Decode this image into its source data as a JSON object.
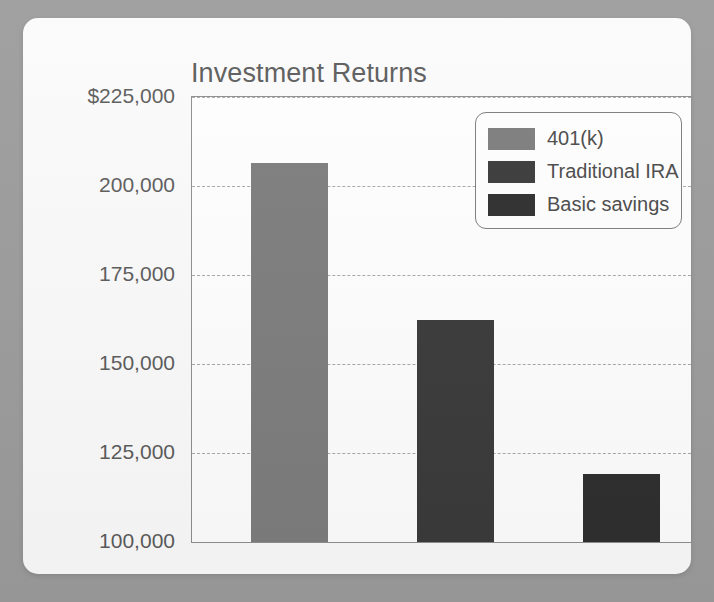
{
  "card": {
    "background_color": "#fbfbfb",
    "page_background_color": "#9c9c9c"
  },
  "chart_data": {
    "type": "bar",
    "title": "Investment Returns",
    "xlabel": "",
    "ylabel": "",
    "categories": [
      "401(k)",
      "Traditional IRA",
      "Basic savings"
    ],
    "values": [
      206500,
      162300,
      119000
    ],
    "ylim": [
      100000,
      225000
    ],
    "yticks": [
      100000,
      125000,
      150000,
      175000,
      200000,
      225000
    ],
    "ytick_labels": [
      "100,000",
      "125,000",
      "150,000",
      "175,000",
      "200,000",
      "$225,000"
    ],
    "grid": true,
    "legend_position": "upper right",
    "series": [
      {
        "name": "401(k)",
        "value": 206500,
        "color": "#7d7d7d"
      },
      {
        "name": "Traditional IRA",
        "value": 162300,
        "color": "#3a3a3a"
      },
      {
        "name": "Basic savings",
        "value": 119000,
        "color": "#2e2e2e"
      }
    ],
    "legend": [
      {
        "label": "401(k)",
        "color": "#7d7d7d"
      },
      {
        "label": "Traditional IRA",
        "color": "#3a3a3a"
      },
      {
        "label": "Basic savings",
        "color": "#2e2e2e"
      }
    ],
    "axis_color": "#8e8e8e",
    "gridline_color": "#a9a9a9",
    "tick_label_color": "#5b5b5b",
    "title_color": "#5b5b5b"
  }
}
